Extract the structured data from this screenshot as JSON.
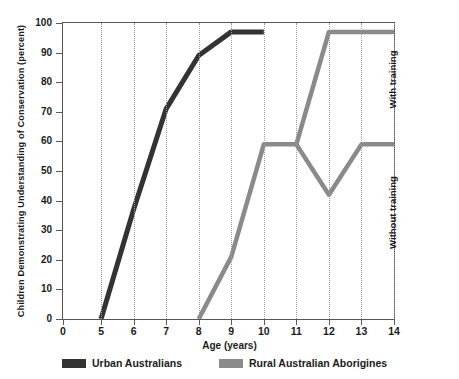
{
  "chart_data": {
    "type": "line",
    "title": "",
    "xlabel": "Age (years)",
    "ylabel": "Children Demonstrating Understanding of Conservation (percent)",
    "xlim": [
      0,
      14
    ],
    "ylim": [
      0,
      100
    ],
    "xticks": [
      0,
      5,
      6,
      7,
      8,
      9,
      10,
      11,
      12,
      13,
      14
    ],
    "xtick_labels": [
      "0",
      "5",
      "6",
      "7",
      "8",
      "9",
      "10",
      "11",
      "12",
      "13",
      "14"
    ],
    "yticks": [
      0,
      10,
      20,
      30,
      40,
      50,
      60,
      70,
      80,
      90,
      100
    ],
    "ytick_labels": [
      "0",
      "10",
      "20",
      "30",
      "40",
      "50",
      "60",
      "70",
      "80",
      "90",
      "100"
    ],
    "grid": "vertical-dotted",
    "legend_position": "bottom",
    "series": [
      {
        "name": "Urban Australians",
        "color": "#333333",
        "x": [
          5,
          6,
          7,
          8,
          9,
          10
        ],
        "values": [
          0,
          37,
          71,
          89,
          97,
          97
        ]
      },
      {
        "name": "Rural Australian Aborigines",
        "color": "#8a8a8a",
        "x": [
          8,
          9,
          10,
          11
        ],
        "values": [
          0,
          21,
          59,
          59
        ]
      },
      {
        "name": "Rural Australian Aborigines (with training)",
        "color": "#8a8a8a",
        "x": [
          11,
          12,
          13,
          14
        ],
        "values": [
          59,
          97,
          97,
          97
        ]
      },
      {
        "name": "Rural Australian Aborigines (without training)",
        "color": "#8a8a8a",
        "x": [
          11,
          12,
          13,
          14
        ],
        "values": [
          59,
          42,
          59,
          59
        ]
      }
    ],
    "annotations": [
      {
        "text": "With training",
        "x": 14,
        "y": 80,
        "rotation": -90
      },
      {
        "text": "Without training",
        "x": 14,
        "y": 35,
        "rotation": -90
      }
    ]
  },
  "legend": {
    "items": [
      {
        "label": "Urban Australians",
        "color": "#333333"
      },
      {
        "label": "Rural Australian Aborigines",
        "color": "#8a8a8a"
      }
    ]
  },
  "colors": {
    "urban": "#333333",
    "rural": "#8a8a8a",
    "axis": "#565656",
    "grid": "#9a9a9a",
    "text": "#1b1b1b"
  }
}
